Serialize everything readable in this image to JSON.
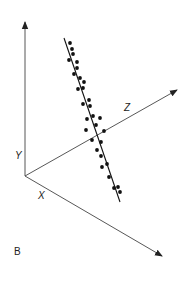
{
  "figure": {
    "panel_label": "B",
    "colors": {
      "axis": "#444444",
      "points": "#111111",
      "fit_line": "#111111",
      "background": "#ffffff"
    },
    "axes": {
      "origin": [
        25,
        176
      ],
      "y": {
        "label": "Y",
        "end": [
          25,
          22
        ],
        "label_pos": [
          15,
          159
        ]
      },
      "z": {
        "label": "Z",
        "end": [
          177,
          90
        ],
        "label_pos": [
          124,
          111
        ]
      },
      "x": {
        "label": "X",
        "end": [
          162,
          256
        ],
        "label_pos": [
          38,
          199
        ]
      }
    },
    "fit_line": {
      "start": [
        64,
        38
      ],
      "end": [
        120,
        202
      ]
    },
    "points": [
      [
        70,
        43
      ],
      [
        72,
        49
      ],
      [
        73,
        54
      ],
      [
        69,
        60
      ],
      [
        77,
        62
      ],
      [
        77,
        68
      ],
      [
        74,
        74
      ],
      [
        80,
        78
      ],
      [
        84,
        82
      ],
      [
        83,
        88
      ],
      [
        78,
        89
      ],
      [
        89,
        100
      ],
      [
        83,
        104
      ],
      [
        90,
        106
      ],
      [
        87,
        119
      ],
      [
        93,
        116
      ],
      [
        100,
        118
      ],
      [
        96,
        125
      ],
      [
        86,
        130
      ],
      [
        104,
        131
      ],
      [
        92,
        140
      ],
      [
        101,
        142
      ],
      [
        97,
        150
      ],
      [
        101,
        156
      ],
      [
        102,
        167
      ],
      [
        107,
        164
      ],
      [
        109,
        177
      ],
      [
        114,
        188
      ],
      [
        118,
        187
      ],
      [
        120,
        192
      ]
    ]
  },
  "chart_data": {
    "type": "scatter",
    "title": "",
    "panel": "B",
    "axes_labels": [
      "X",
      "Y",
      "Z"
    ],
    "note": "3D scatter of ~30 points tightly clustered along a single fitted line; line runs steeply from upper-left (high Y) to lower-right (low Y, high X), positioned partly in front of the Z axis.",
    "grid": false,
    "legend": null
  }
}
